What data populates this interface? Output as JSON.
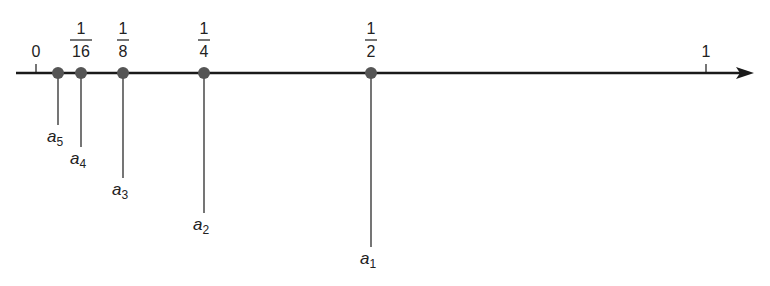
{
  "diagram": {
    "title": "",
    "axis": {
      "y": 73,
      "x_start": 16,
      "x_end": 754,
      "color": "#1a1a1a"
    },
    "scale": {
      "origin_x": 36,
      "unit_x": 706
    },
    "ticks": [
      {
        "value": 0,
        "label": "0",
        "x": 36
      },
      {
        "value": 1,
        "label": "1",
        "x": 706
      }
    ],
    "points": [
      {
        "name": "a5",
        "base": "a",
        "sub": "5",
        "value": 0.03125,
        "x": 58,
        "label_top": null,
        "line_end_y": 125
      },
      {
        "name": "a4",
        "base": "a",
        "sub": "4",
        "value": 0.0625,
        "x": 81,
        "label_top": {
          "num": "1",
          "den": "16"
        },
        "line_end_y": 147
      },
      {
        "name": "a3",
        "base": "a",
        "sub": "3",
        "value": 0.125,
        "x": 123,
        "label_top": {
          "num": "1",
          "den": "8"
        },
        "line_end_y": 178
      },
      {
        "name": "a2",
        "base": "a",
        "sub": "2",
        "value": 0.25,
        "x": 204,
        "label_top": {
          "num": "1",
          "den": "4"
        },
        "line_end_y": 213
      },
      {
        "name": "a1",
        "base": "a",
        "sub": "1",
        "value": 0.5,
        "x": 371,
        "label_top": {
          "num": "1",
          "den": "2"
        },
        "line_end_y": 247
      }
    ],
    "colors": {
      "dot": "#555555",
      "line": "#1a1a1a",
      "text": "#222222"
    }
  }
}
